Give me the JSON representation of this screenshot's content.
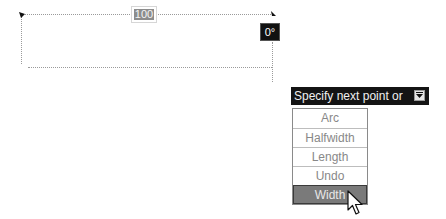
{
  "drawing": {
    "dimension_value": "100",
    "angle_tooltip": "0°"
  },
  "prompt": {
    "text": "Specify next point or",
    "icon": "down-arrow-icon"
  },
  "options_menu": {
    "items": [
      {
        "label": "Arc"
      },
      {
        "label": "Halfwidth"
      },
      {
        "label": "Length"
      },
      {
        "label": "Undo"
      },
      {
        "label": "Width",
        "highlighted": true
      }
    ]
  },
  "cursor": {
    "icon": "arrow-cursor-icon"
  }
}
